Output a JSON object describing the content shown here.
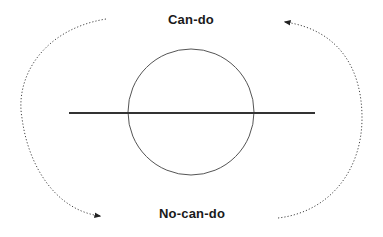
{
  "diagram": {
    "labels": {
      "top": "Can-do",
      "bottom": "No-can-do"
    },
    "elements": {
      "circle": {
        "cx": 191,
        "cy": 112,
        "r": 63,
        "stroke": "#555555"
      },
      "axis_line": {
        "x1": 69,
        "y1": 113,
        "x2": 315,
        "y2": 113,
        "stroke": "#333333"
      },
      "left_arrow": {
        "style": "dotted",
        "direction": "top-to-bottom",
        "arrowhead": "bottom-right"
      },
      "right_arrow": {
        "style": "dotted",
        "direction": "bottom-to-top",
        "arrowhead": "top-left"
      }
    },
    "colors": {
      "text": "#1a1a1a",
      "line": "#333333",
      "circle": "#555555",
      "dotted": "#444444"
    }
  }
}
